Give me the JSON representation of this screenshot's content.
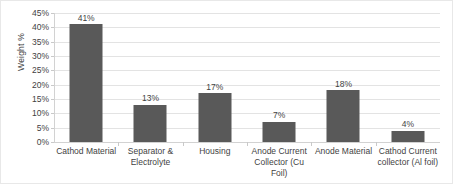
{
  "chart_data": {
    "type": "bar",
    "title": "",
    "subtitle": "",
    "xlabel": "",
    "ylabel": "Weight %",
    "ylim": [
      0,
      45
    ],
    "ytick_labels": [
      "45%",
      "40%",
      "35%",
      "30%",
      "25%",
      "20%",
      "15%",
      "10%",
      "5%",
      "0%"
    ],
    "ytick_values": [
      45,
      40,
      35,
      30,
      25,
      20,
      15,
      10,
      5,
      0
    ],
    "grid": true,
    "legend": false,
    "legend_position": "none",
    "categories": [
      "Cathod Material",
      "Separator & Electrolyte",
      "Housing",
      "Anode Current Collector (Cu Foil)",
      "Anode Material",
      "Cathod Current collector (Al foil)"
    ],
    "category_lines": [
      [
        "Cathod Material"
      ],
      [
        "Separator &",
        "Electrolyte"
      ],
      [
        "Housing"
      ],
      [
        "Anode Current",
        "Collector (Cu Foil)"
      ],
      [
        "Anode Material"
      ],
      [
        "Cathod Current",
        "collector (Al foil)"
      ]
    ],
    "values": [
      41,
      13,
      17,
      7,
      18,
      4
    ],
    "data_labels": [
      "41%",
      "13%",
      "17%",
      "7%",
      "18%",
      "4%"
    ],
    "bar_color": "#595959",
    "gridline_color": "#e3e3e3",
    "axis_color": "#d2d2d2",
    "border_color": "#e8e8e8",
    "text_color": "#3f3f3f"
  }
}
